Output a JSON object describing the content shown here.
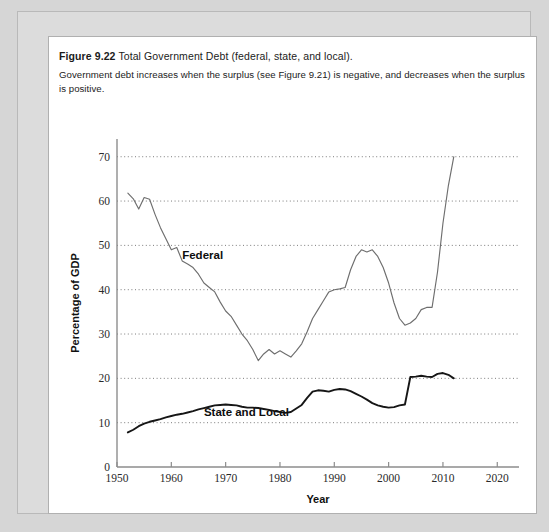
{
  "caption": {
    "figure_number": "Figure 9.22",
    "title": "Total Government Debt (federal, state, and local).",
    "body": "Government debt increases when the surplus (see Figure 9.21) is negative, and decreases when the surplus is positive."
  },
  "chart_data": {
    "type": "line",
    "title": "Total Government Debt (federal, state, and local)",
    "xlabel": "Year",
    "ylabel": "Percentage of GDP",
    "xlim": [
      1950,
      2024
    ],
    "ylim": [
      0,
      74
    ],
    "xticks": [
      1950,
      1960,
      1970,
      1980,
      1990,
      2000,
      2010,
      2020
    ],
    "yticks": [
      0,
      10,
      20,
      30,
      40,
      50,
      60,
      70
    ],
    "grid": "horizontal-dotted",
    "legend": "inline-labels",
    "annotations": [
      {
        "text": "Federal",
        "x": 1962,
        "y": 47
      },
      {
        "text": "State and Local",
        "x": 1966,
        "y": 11.4
      }
    ],
    "series": [
      {
        "name": "Federal",
        "color": "#6e6e6e",
        "x": [
          1952,
          1953,
          1954,
          1955,
          1956,
          1957,
          1958,
          1959,
          1960,
          1961,
          1962,
          1963,
          1964,
          1965,
          1966,
          1967,
          1968,
          1969,
          1970,
          1971,
          1972,
          1973,
          1974,
          1975,
          1976,
          1977,
          1978,
          1979,
          1980,
          1981,
          1982,
          1983,
          1984,
          1985,
          1986,
          1987,
          1988,
          1989,
          1990,
          1991,
          1992,
          1993,
          1994,
          1995,
          1996,
          1997,
          1998,
          1999,
          2000,
          2001,
          2002,
          2003,
          2004,
          2005,
          2006,
          2007,
          2008,
          2009,
          2010,
          2011,
          2012
        ],
        "y": [
          61.8,
          60.5,
          58.2,
          60.8,
          60.4,
          57.0,
          54.0,
          51.5,
          49.0,
          49.5,
          46.5,
          45.8,
          45.0,
          43.5,
          41.5,
          40.5,
          39.5,
          37.2,
          35.2,
          34.0,
          32.0,
          30.0,
          28.5,
          26.5,
          24.0,
          25.5,
          26.5,
          25.5,
          26.2,
          25.5,
          24.8,
          26.2,
          27.8,
          30.5,
          33.5,
          35.5,
          37.5,
          39.5,
          40.0,
          40.2,
          40.5,
          44.5,
          47.5,
          49.0,
          48.5,
          49.0,
          47.5,
          45.0,
          41.5,
          37.0,
          33.5,
          32.0,
          32.5,
          33.5,
          35.5,
          36.0,
          36.0,
          44.0,
          55.0,
          63.5,
          70.0
        ]
      },
      {
        "name": "State and Local",
        "color": "#161616",
        "x": [
          1952,
          1953,
          1954,
          1955,
          1956,
          1957,
          1958,
          1959,
          1960,
          1961,
          1962,
          1963,
          1964,
          1965,
          1966,
          1967,
          1968,
          1969,
          1970,
          1971,
          1972,
          1973,
          1974,
          1975,
          1976,
          1977,
          1978,
          1979,
          1980,
          1981,
          1982,
          1983,
          1984,
          1985,
          1986,
          1987,
          1988,
          1989,
          1990,
          1991,
          1992,
          1993,
          1994,
          1995,
          1996,
          1997,
          1998,
          1999,
          2000,
          2001,
          2002,
          2003,
          2004,
          2005,
          2006,
          2007,
          2008,
          2009,
          2010,
          2011,
          2012
        ],
        "y": [
          7.8,
          8.4,
          9.2,
          9.8,
          10.2,
          10.5,
          10.8,
          11.2,
          11.5,
          11.8,
          12.0,
          12.3,
          12.6,
          13.0,
          13.3,
          13.6,
          13.9,
          14.0,
          14.1,
          14.0,
          13.9,
          13.6,
          13.4,
          13.4,
          13.3,
          13.1,
          12.9,
          12.6,
          12.4,
          12.2,
          12.4,
          13.2,
          14.0,
          15.6,
          17.0,
          17.3,
          17.2,
          17.0,
          17.4,
          17.6,
          17.5,
          17.1,
          16.5,
          15.9,
          15.2,
          14.4,
          13.9,
          13.6,
          13.4,
          13.5,
          13.9,
          14.1,
          20.3,
          20.4,
          20.6,
          20.4,
          20.3,
          21.0,
          21.2,
          20.8,
          20.0
        ]
      }
    ]
  }
}
